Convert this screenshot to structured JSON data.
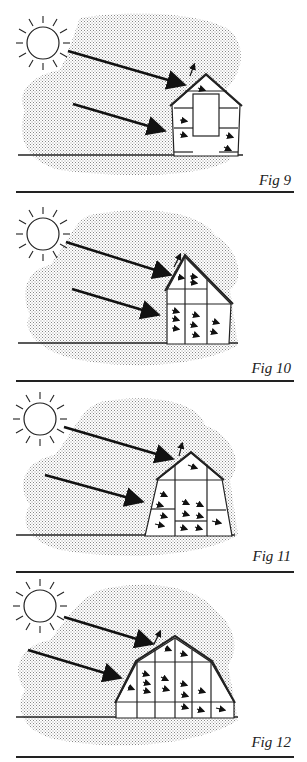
{
  "figures": [
    {
      "id": "fig9",
      "caption": "Fig 9",
      "description": "Small gable greenhouse with central door; sun rays entering through roof and wall"
    },
    {
      "id": "fig10",
      "caption": "Fig 10",
      "description": "Lean-to style greenhouse with steep south-facing roof; many internal heat arrows"
    },
    {
      "id": "fig11",
      "caption": "Fig 11",
      "description": "Greenhouse with sloped sidewalls and gable roof; more internal heat arrows"
    },
    {
      "id": "fig12",
      "caption": "Fig 12",
      "description": "Wide gambrel-roof greenhouse with sloping walls; most internal heat arrows"
    }
  ],
  "colors": {
    "ink": "#222222",
    "stipple": "#b8b8b8",
    "background": "#ffffff"
  }
}
